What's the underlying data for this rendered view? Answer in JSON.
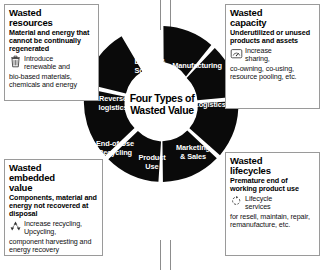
{
  "wheel": {
    "hub_line1": "Four Types of",
    "hub_line2": "Wasted Value",
    "segments": [
      {
        "id": "design-sourcing",
        "line1": "Design &",
        "line2": "Sourcing"
      },
      {
        "id": "manufacturing",
        "line1": "Manufacturing",
        "line2": ""
      },
      {
        "id": "logistics",
        "line1": "Logistics",
        "line2": ""
      },
      {
        "id": "marketing-sales",
        "line1": "Marketing",
        "line2": "& Sales"
      },
      {
        "id": "product-use",
        "line1": "Product",
        "line2": "Use"
      },
      {
        "id": "end-of-use-recycling",
        "line1": "End-of Use",
        "line2": "Recycling"
      },
      {
        "id": "reverse-logistics",
        "line1": "Reverse",
        "line2": "logistics"
      }
    ],
    "colors": {
      "segment": "#0a0a0a",
      "hub": "#ffffff",
      "label": "#ffffff"
    }
  },
  "panels": {
    "resources": {
      "title_line1": "Wasted",
      "title_line2": "resources",
      "subtitle": "Material and energy that cannot be continually regenerated",
      "icon": "trash-bin-icon",
      "bullet_head": "Introduce",
      "bullet_rest": "renewable and",
      "bullet_tail": "bio-based materials, chemicals and energy"
    },
    "capacity": {
      "title_line1": "Wasted",
      "title_line2": "capacity",
      "subtitle": "Underutilized or unused products and assets",
      "icon": "gauge-icon",
      "bullet_head": "Increase",
      "bullet_rest": "sharing,",
      "bullet_tail": "co-owning, co-using, resource pooling, etc."
    },
    "embedded": {
      "title_line1": "Wasted",
      "title_line2": "embedded",
      "title_line3": "value",
      "subtitle": "Components, material and energy not recovered at disposal",
      "icon": "recycling-arrows-icon",
      "bullet_head": "Increase recycling,",
      "bullet_rest": "Upcycling,",
      "bullet_tail": "component harvesting and energy recovery"
    },
    "lifecycles": {
      "title_line1": "Wasted",
      "title_line2": "lifecycles",
      "subtitle": "Premature end of working product use",
      "icon": "lifecycle-loop-icon",
      "bullet_head": "Lifecycle",
      "bullet_rest": "services",
      "bullet_tail": "for resell, maintain, repair, remanufacture, etc."
    }
  },
  "colors": {
    "background": "#ffffff",
    "panel_border": "#9a9a9a",
    "connector": "#8d8d8d",
    "text": "#000000"
  }
}
